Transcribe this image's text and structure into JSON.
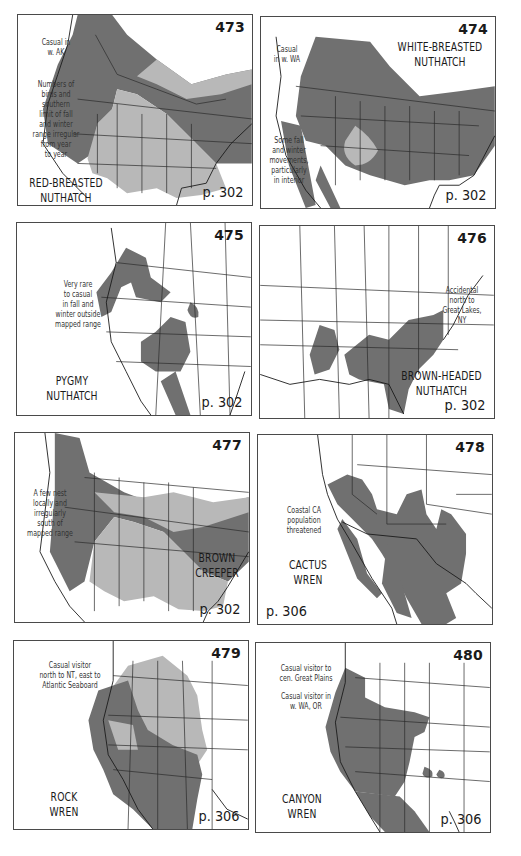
{
  "colors": {
    "background": "#ffffff",
    "frame": "#4a4a4a",
    "range_primary": "#707070",
    "range_secondary": "#b8b8b8",
    "borders": "#2a2a2a"
  },
  "maps": [
    {
      "number": "473",
      "species": "RED-BREASTED\nNUTHATCH",
      "page_ref": "p. 302",
      "notes": [
        "Casual in\nw. AK",
        "Numbers of\nbirds and\nsouthern\nlimit of fall\nand winter\nrange irregular\nfrom year\nto year"
      ]
    },
    {
      "number": "474",
      "species": "WHITE-BREASTED\nNUTHATCH",
      "page_ref": "p. 302",
      "notes": [
        "Casual\nin w. WA",
        "Some fall\nand winter\nmovements,\nparticularly\nin interior"
      ]
    },
    {
      "number": "475",
      "species": "PYGMY\nNUTHATCH",
      "page_ref": "p. 302",
      "notes": [
        "Very rare\nto casual\nin fall and\nwinter outside\nmapped range"
      ]
    },
    {
      "number": "476",
      "species": "BROWN-HEADED\nNUTHATCH",
      "page_ref": "p. 302",
      "notes": [
        "Accidental\nnorth to\nGreat Lakes,\nNY"
      ]
    },
    {
      "number": "477",
      "species": "BROWN\nCREEPER",
      "page_ref": "p. 302",
      "notes": [
        "A few nest\nlocally and\nirregularly\nsouth of\nmapped range"
      ]
    },
    {
      "number": "478",
      "species": "CACTUS\nWREN",
      "page_ref": "p. 306",
      "notes": [
        "Coastal CA\npopulation\nthreatened"
      ]
    },
    {
      "number": "479",
      "species": "ROCK\nWREN",
      "page_ref": "p. 306",
      "notes": [
        "Casual visitor\nnorth to NT, east to\nAtlantic Seaboard"
      ]
    },
    {
      "number": "480",
      "species": "CANYON\nWREN",
      "page_ref": "p. 306",
      "notes": [
        "Casual visitor to\ncen. Great Plains",
        "Casual visitor in\nw. WA, OR"
      ]
    }
  ]
}
